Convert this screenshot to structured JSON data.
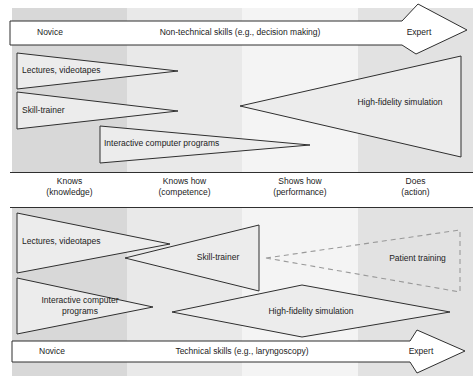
{
  "colors": {
    "page_bg": "#ffffff",
    "band_knows": "#d8d8d8",
    "band_knows_how": "#e9e9e9",
    "band_shows_how": "#f4f4f4",
    "band_does": "#e2e2e2",
    "shape_fill": "#ececec",
    "arrow_fill": "#ffffff",
    "outline": "#2f2f2f",
    "dashed_outline": "#999999",
    "text": "#222222"
  },
  "top_axis": {
    "left": "Novice",
    "title": "Non-technical skills (e.g., decision making)",
    "right": "Expert"
  },
  "top_methods": {
    "lectures": "Lectures, videotapes",
    "skill_trainer": "Skill-trainer",
    "interactive": "Interactive computer programs",
    "high_fidelity": "High-fidelity simulation"
  },
  "miller_levels": [
    {
      "label": "Knows",
      "sublabel": "(knowledge)"
    },
    {
      "label": "Knows how",
      "sublabel": "(competence)"
    },
    {
      "label": "Shows how",
      "sublabel": "(performance)"
    },
    {
      "label": "Does",
      "sublabel": "(action)"
    }
  ],
  "bottom_methods": {
    "lectures": "Lectures, videotapes",
    "skill_trainer": "Skill-trainer",
    "patient_training": "Patient training",
    "interactive": "Interactive computer programs",
    "high_fidelity": "High-fidelity simulation"
  },
  "bottom_axis": {
    "left": "Novice",
    "title": "Technical skills (e.g., laryngoscopy)",
    "right": "Expert"
  }
}
